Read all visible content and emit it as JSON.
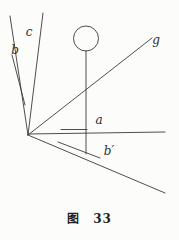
{
  "figure": {
    "caption": {
      "prefix": "图",
      "number": "33"
    }
  },
  "diagram": {
    "stroke_color": "#3a3a3a",
    "background_color": "#fcfcfa",
    "viewbox": "0 0 179 205",
    "lines": [
      {
        "name": "line-b",
        "x1": 10,
        "y1": 16,
        "x2": 28,
        "y2": 135
      },
      {
        "name": "line-b-double-stroke",
        "x1": 12,
        "y1": 55,
        "x2": 25,
        "y2": 105
      },
      {
        "name": "line-c",
        "x1": 43,
        "y1": 13,
        "x2": 28,
        "y2": 135
      },
      {
        "name": "line-g",
        "x1": 28,
        "y1": 135,
        "x2": 152,
        "y2": 38
      },
      {
        "name": "line-axis-horizontal",
        "x1": 28,
        "y1": 134,
        "x2": 165,
        "y2": 132
      },
      {
        "name": "line-a-mark",
        "x1": 61,
        "y1": 129.5,
        "x2": 87,
        "y2": 129.5
      },
      {
        "name": "line-axis-diagonal",
        "x1": 28,
        "y1": 135,
        "x2": 165,
        "y2": 193
      },
      {
        "name": "line-b-prime-mark",
        "x1": 58,
        "y1": 142,
        "x2": 100,
        "y2": 158
      },
      {
        "name": "line-stem",
        "x1": 86,
        "y1": 51,
        "x2": 86,
        "y2": 154
      }
    ],
    "circle": {
      "name": "head-circle",
      "cx": 86,
      "cy": 38.5,
      "r": 12.5
    },
    "labels": [
      {
        "name": "label-c",
        "text": "c",
        "x": 29,
        "y": 36
      },
      {
        "name": "label-b",
        "text": "b",
        "x": 15,
        "y": 54
      },
      {
        "name": "label-g",
        "text": "g",
        "x": 156,
        "y": 44
      },
      {
        "name": "label-a",
        "text": "a",
        "x": 99,
        "y": 124
      },
      {
        "name": "label-b-prime",
        "text": "b′",
        "x": 109,
        "y": 155
      }
    ]
  }
}
